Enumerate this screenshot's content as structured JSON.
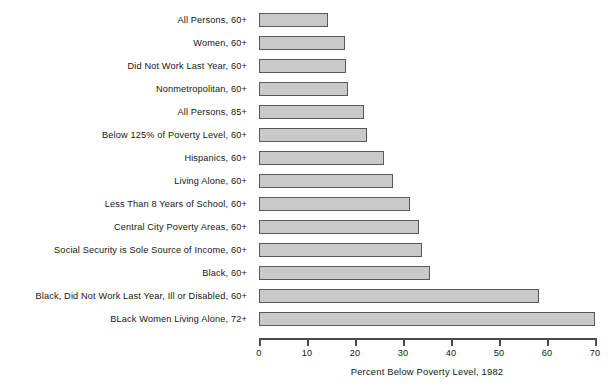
{
  "chart_data": {
    "type": "bar",
    "orientation": "horizontal",
    "title": "",
    "xlabel": "Percent Below Poverty Level, 1982",
    "ylabel": "",
    "xlim": [
      0,
      70
    ],
    "xticks": [
      0,
      10,
      20,
      30,
      40,
      50,
      60,
      70
    ],
    "xtick_labels": [
      "0",
      "10",
      "20",
      "30",
      "40",
      "50",
      "60",
      "70"
    ],
    "grid": false,
    "legend": "none",
    "bar_fill_color": "#c9c9c9",
    "bar_edge_color": "#595959",
    "categories": [
      "All Persons, 60+",
      "Women, 60+",
      "Did Not Work Last Year, 60+",
      "Nonmetropolitan, 60+",
      "All Persons, 85+",
      "Below 125% of Poverty Level, 60+",
      "Hispanics, 60+",
      "Living Alone, 60+",
      "Less Than 8 Years of School, 60+",
      "Central City Poverty Areas, 60+",
      "Social Security is Sole Source of Income, 60+",
      "Black, 60+",
      "Black, Did Not Work Last Year, Ill or Disabled, 60+",
      "BLack Women Living Alone, 72+"
    ],
    "values": [
      14.4,
      18.0,
      18.1,
      18.5,
      21.8,
      22.4,
      26.1,
      28.0,
      31.4,
      33.4,
      34.0,
      35.7,
      58.3,
      70.0
    ]
  }
}
